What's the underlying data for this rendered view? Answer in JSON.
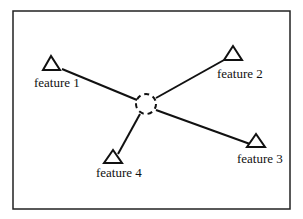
{
  "diagram": {
    "center": {
      "name": "unknown-location",
      "shape": "dashed-circle"
    },
    "features": [
      {
        "label": "feature 1"
      },
      {
        "label": "feature 2"
      },
      {
        "label": "feature 3"
      },
      {
        "label": "feature 4"
      }
    ],
    "colors": {
      "stroke": "#111111",
      "background": "#ffffff"
    }
  }
}
